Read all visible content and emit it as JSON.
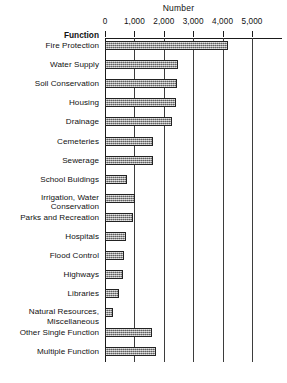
{
  "chart_data": {
    "type": "bar",
    "orientation": "horizontal",
    "title": "Number",
    "xlabel": "Number",
    "ylabel": "Function",
    "xlim": [
      0,
      5000
    ],
    "grid": true,
    "legend": null,
    "xticks": [
      0,
      1000,
      2000,
      3000,
      4000,
      5000
    ],
    "xtick_labels": [
      "0",
      "1,000",
      "2,000",
      "3,000",
      "4,000",
      "5,000"
    ],
    "categories": [
      "Fire Protection",
      "Water Supply",
      "Soil Conservation",
      "Housing",
      "Drainage",
      "Cemeteries",
      "Sewerage",
      "School Buidings",
      "Irrigation, Water Conservation",
      "Parks and Recreation",
      "Hospitals",
      "Flood Control",
      "Highways",
      "Libraries",
      "Natural Resources, Miscellaneous",
      "Other Single Function",
      "Multiple Function"
    ],
    "values": [
      4200,
      2480,
      2450,
      2420,
      2280,
      1640,
      1630,
      750,
      1020,
      950,
      700,
      650,
      610,
      480,
      280,
      1600,
      1730
    ]
  },
  "axis": {
    "y_heading": "Function",
    "x_title": "Number"
  },
  "rows": [
    {
      "label_line1": "Fire Protection",
      "label_line2": "",
      "value": 4200
    },
    {
      "label_line1": "Water Supply",
      "label_line2": "",
      "value": 2480
    },
    {
      "label_line1": "Soil Conservation",
      "label_line2": "",
      "value": 2450
    },
    {
      "label_line1": "Housing",
      "label_line2": "",
      "value": 2420
    },
    {
      "label_line1": "Drainage",
      "label_line2": "",
      "value": 2280
    },
    {
      "label_line1": "Cemeteries",
      "label_line2": "",
      "value": 1640
    },
    {
      "label_line1": "Sewerage",
      "label_line2": "",
      "value": 1630
    },
    {
      "label_line1": "School Buidings",
      "label_line2": "",
      "value": 750
    },
    {
      "label_line1": "Irrigation, Water",
      "label_line2": "Conservation",
      "value": 1020
    },
    {
      "label_line1": "Parks and Recreation",
      "label_line2": "",
      "value": 950
    },
    {
      "label_line1": "Hospitals",
      "label_line2": "",
      "value": 700
    },
    {
      "label_line1": "Flood Control",
      "label_line2": "",
      "value": 650
    },
    {
      "label_line1": "Highways",
      "label_line2": "",
      "value": 610
    },
    {
      "label_line1": "Libraries",
      "label_line2": "",
      "value": 480
    },
    {
      "label_line1": "Natural Resources,",
      "label_line2": "Miscellaneous",
      "value": 280
    },
    {
      "label_line1": "Other Single Function",
      "label_line2": "",
      "value": 1600
    },
    {
      "label_line1": "Multiple Function",
      "label_line2": "",
      "value": 1730
    }
  ],
  "colors": {
    "bar_fill": "#9a9a9a",
    "bar_border": "#222222",
    "axis": "#1a1a1a",
    "gridline": "#3d3d3d",
    "text": "#111111",
    "background": "#ffffff"
  }
}
